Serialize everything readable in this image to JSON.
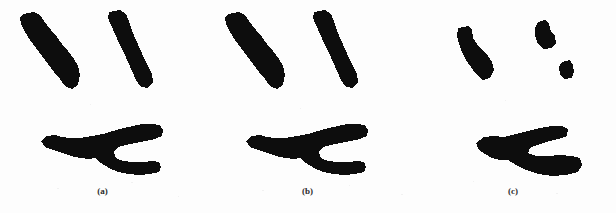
{
  "figure": {
    "background_color": "#fdfdfd",
    "ink_color": "#0d0d0d",
    "width": 616,
    "height": 213,
    "panels": [
      {
        "id": "a",
        "caption": "(a)",
        "caption_x": 103,
        "caption_y": 186,
        "origin_x": 0,
        "shapes": [
          {
            "name": "diagonal-bar-left",
            "kind": "silhouette-bar",
            "points": "23,14 34,12 40,15 44,21 51,30 57,37 62,44 68,51 74,59 78,66 80,75 78,85 72,89 65,86 60,79 54,72 48,64 42,56 36,48 30,40 25,32 21,24 20,18"
          },
          {
            "name": "diagonal-bar-right",
            "kind": "silhouette-bar",
            "points": "109,12 120,10 126,14 129,21 132,31 136,40 140,49 144,58 148,66 152,74 153,82 148,88 141,87 136,80 132,71 128,62 124,53 119,43 115,34 111,25 108,18"
          },
          {
            "name": "pliers-silhouette",
            "kind": "silhouette-pliers",
            "points": "41,141 47,136 55,135 62,137 70,138 80,138 92,136 103,134 113,131 124,128 133,126 142,124 152,124 160,125 163,130 162,136 155,139 145,141 135,143 126,145 118,147 114,152 116,158 123,161 133,162 143,162 152,161 159,162 161,167 159,172 150,174 139,175 128,174 118,172 109,168 101,163 95,158 89,159 80,158 71,156 62,153 53,150 45,147"
          }
        ]
      },
      {
        "id": "b",
        "caption": "(b)",
        "caption_x": 308,
        "caption_y": 186,
        "origin_x": 205,
        "shapes": [
          {
            "name": "diagonal-bar-left",
            "kind": "silhouette-bar",
            "points": "23,14 34,12 40,15 44,21 51,30 57,37 62,44 68,51 74,59 78,66 80,75 78,85 72,89 65,86 60,79 54,72 48,64 42,56 36,48 30,40 25,32 21,24 20,18"
          },
          {
            "name": "diagonal-bar-right",
            "kind": "silhouette-bar",
            "points": "109,12 120,10 126,14 129,21 132,31 136,40 140,49 144,58 148,66 152,74 153,82 148,88 141,87 136,80 132,71 128,62 124,53 119,43 115,34 111,25 108,18"
          },
          {
            "name": "pliers-silhouette",
            "kind": "silhouette-pliers",
            "points": "41,141 47,136 55,135 62,137 70,138 80,138 92,136 103,134 113,131 124,128 133,126 142,124 152,124 160,125 163,130 162,136 155,139 145,141 135,143 126,145 118,147 114,152 116,158 123,161 133,162 143,162 152,161 159,162 161,167 159,172 150,174 139,175 128,174 118,172 109,168 101,163 95,158 89,159 80,158 71,156 62,153 53,150 45,147"
          }
        ]
      },
      {
        "id": "c",
        "caption": "(c)",
        "caption_x": 514,
        "caption_y": 186,
        "origin_x": 410,
        "shapes": [
          {
            "name": "diagonal-bar-left-fragment",
            "kind": "silhouette-fragment",
            "points": "48,28 58,26 62,30 63,38 67,44 72,50 78,56 82,62 84,70 80,78 73,80 66,74 61,67 56,60 52,52 49,44 47,36"
          },
          {
            "name": "diagonal-bar-right-fragment-upper",
            "kind": "silhouette-fragment",
            "points": "128,22 135,20 139,24 141,32 145,36 146,43 142,48 134,49 128,44 125,36 125,28"
          },
          {
            "name": "diagonal-bar-right-fragment-lower",
            "kind": "silhouette-fragment",
            "points": "152,62 160,60 163,65 164,72 162,78 154,79 150,74 149,67"
          },
          {
            "name": "pliers-silhouette-degraded",
            "kind": "silhouette-pliers-degraded",
            "points": "66,143 74,137 84,136 94,137 106,134 118,131 130,128 142,126 152,126 158,129 157,136 148,139 136,142 127,145 120,148 118,153 126,156 138,156 150,155 162,156 170,158 172,165 168,172 156,175 142,176 128,174 116,170 106,165 98,160 90,160 82,158 75,154 69,150"
          }
        ]
      }
    ]
  }
}
